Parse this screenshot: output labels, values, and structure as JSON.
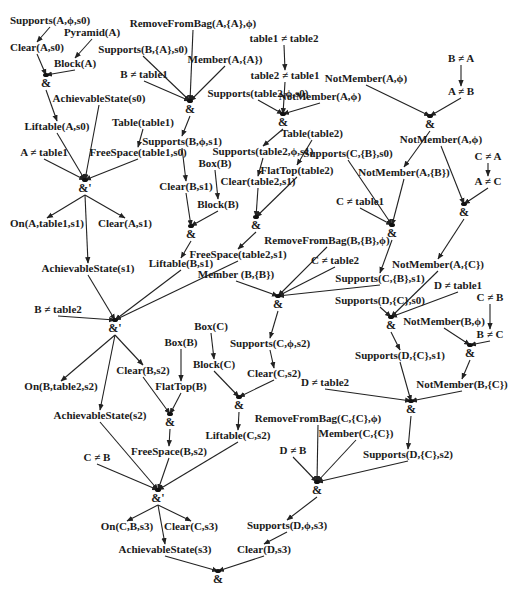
{
  "diagram": {
    "type": "and-or derivation graph",
    "nodes": [
      {
        "id": "n1",
        "label": "Supports(A,ϕ,s0)",
        "x": 50,
        "y": 24
      },
      {
        "id": "n2",
        "label": "Pyramid(A)",
        "x": 92,
        "y": 36
      },
      {
        "id": "n3",
        "label": "Clear(A,s0)",
        "x": 37,
        "y": 51
      },
      {
        "id": "n4",
        "label": "Block(A)",
        "x": 75,
        "y": 67
      },
      {
        "id": "n5",
        "label": "RemoveFromBag(A,{A},ϕ)",
        "x": 193,
        "y": 27
      },
      {
        "id": "n6",
        "label": "Supports(B,{A},s0)",
        "x": 143,
        "y": 53
      },
      {
        "id": "n7",
        "label": "Member(A,{A})",
        "x": 225,
        "y": 63
      },
      {
        "id": "n8",
        "label": "B ≠ table1",
        "x": 144,
        "y": 78
      },
      {
        "id": "n9",
        "label": "AchievableState(s0)",
        "x": 99,
        "y": 102
      },
      {
        "id": "n10",
        "label": "Liftable(A,s0)",
        "x": 57,
        "y": 130
      },
      {
        "id": "n11",
        "label": "Table(table1)",
        "x": 143,
        "y": 126
      },
      {
        "id": "n12",
        "label": "Supports(B,ϕ,s1)",
        "x": 182,
        "y": 145
      },
      {
        "id": "n13",
        "label": "A ≠ table1",
        "x": 44,
        "y": 156
      },
      {
        "id": "n14",
        "label": "FreeSpace(table1,s0)",
        "x": 138,
        "y": 156
      },
      {
        "id": "n15",
        "label": "Box(B)",
        "x": 215,
        "y": 167
      },
      {
        "id": "n16",
        "label": "Clear(B,s1)",
        "x": 186,
        "y": 190
      },
      {
        "id": "n17",
        "label": "Block(B)",
        "x": 218,
        "y": 208
      },
      {
        "id": "n18",
        "label": "On(A,table1,s1)",
        "x": 47,
        "y": 227
      },
      {
        "id": "n19",
        "label": "Clear(A,s1)",
        "x": 125,
        "y": 227
      },
      {
        "id": "n20",
        "label": "Liftable(B,s1)",
        "x": 181,
        "y": 267
      },
      {
        "id": "n21",
        "label": "AchievableState(s1)",
        "x": 88,
        "y": 272
      },
      {
        "id": "n22",
        "label": "table1 ≠ table2",
        "x": 284,
        "y": 42
      },
      {
        "id": "n23",
        "label": "table2 ≠ table1",
        "x": 285,
        "y": 79
      },
      {
        "id": "n24",
        "label": "Supports(table2,ϕ,s0)",
        "x": 258,
        "y": 97
      },
      {
        "id": "n25",
        "label": "NotMember(A,ϕ)",
        "x": 320,
        "y": 100
      },
      {
        "id": "n26",
        "label": "Supports(table2,ϕ,s1)",
        "x": 263,
        "y": 155
      },
      {
        "id": "n27",
        "label": "Table(table2)",
        "x": 312,
        "y": 137
      },
      {
        "id": "n28",
        "label": "Clear(table2,s1)",
        "x": 258,
        "y": 185
      },
      {
        "id": "n29",
        "label": "FlatTop(table2)",
        "x": 297,
        "y": 174
      },
      {
        "id": "n30",
        "label": "Supports(C,{B},s0)",
        "x": 348,
        "y": 157
      },
      {
        "id": "n31",
        "label": "B ≠ A",
        "x": 461,
        "y": 62
      },
      {
        "id": "n32",
        "label": "NotMember(A,ϕ)",
        "x": 366,
        "y": 82
      },
      {
        "id": "n33",
        "label": "A ≠ B",
        "x": 461,
        "y": 95
      },
      {
        "id": "n34",
        "label": "NotMember(A,ϕ)",
        "x": 441,
        "y": 143
      },
      {
        "id": "n35",
        "label": "NotMember(A,{B})",
        "x": 404,
        "y": 176
      },
      {
        "id": "n36",
        "label": "C ≠ A",
        "x": 488,
        "y": 160
      },
      {
        "id": "n37",
        "label": "A ≠ C",
        "x": 488,
        "y": 185
      },
      {
        "id": "n38",
        "label": "C ≠ table1",
        "x": 360,
        "y": 205
      },
      {
        "id": "n39",
        "label": "RemoveFromBag(B,{B},ϕ)",
        "x": 327,
        "y": 244
      },
      {
        "id": "n40",
        "label": "FreeSpace(table2,s1)",
        "x": 238,
        "y": 258
      },
      {
        "id": "n41",
        "label": "C ≠ table2",
        "x": 335,
        "y": 264
      },
      {
        "id": "n42",
        "label": "Member (B,{B})",
        "x": 236,
        "y": 278
      },
      {
        "id": "n43",
        "label": "Supports(C,{B},s1)",
        "x": 380,
        "y": 282
      },
      {
        "id": "n44",
        "label": "NotMember(A,{C})",
        "x": 438,
        "y": 268
      },
      {
        "id": "n45",
        "label": "D ≠ table1",
        "x": 458,
        "y": 289
      },
      {
        "id": "n46",
        "label": "Supports(D,{C},s0)",
        "x": 380,
        "y": 304
      },
      {
        "id": "n47",
        "label": "C ≠ B",
        "x": 490,
        "y": 301
      },
      {
        "id": "n48",
        "label": "NotMember(B,ϕ)",
        "x": 444,
        "y": 325
      },
      {
        "id": "n49",
        "label": "B ≠ C",
        "x": 490,
        "y": 338
      },
      {
        "id": "n50",
        "label": "B ≠ table2",
        "x": 58,
        "y": 313
      },
      {
        "id": "n51",
        "label": "Box(C)",
        "x": 211,
        "y": 330
      },
      {
        "id": "n52",
        "label": "Supports(C,ϕ,s2)",
        "x": 270,
        "y": 347
      },
      {
        "id": "n53",
        "label": "Box(B)",
        "x": 181,
        "y": 346
      },
      {
        "id": "n54",
        "label": "Supports(D,{C},s1)",
        "x": 400,
        "y": 359
      },
      {
        "id": "n55",
        "label": "Block(C)",
        "x": 214,
        "y": 368
      },
      {
        "id": "n56",
        "label": "Clear(B,s2)",
        "x": 143,
        "y": 374
      },
      {
        "id": "n57",
        "label": "Clear(C,s2)",
        "x": 274,
        "y": 377
      },
      {
        "id": "n58",
        "label": "On(B,table2,s2)",
        "x": 61,
        "y": 390
      },
      {
        "id": "n59",
        "label": "FlatTop(B)",
        "x": 181,
        "y": 390
      },
      {
        "id": "n60",
        "label": "D ≠ table2",
        "x": 325,
        "y": 386
      },
      {
        "id": "n61",
        "label": "NotMember(B,{C})",
        "x": 462,
        "y": 388
      },
      {
        "id": "n62",
        "label": "AchievableState(s2)",
        "x": 100,
        "y": 419
      },
      {
        "id": "n63",
        "label": "Liftable(C,s2)",
        "x": 238,
        "y": 439
      },
      {
        "id": "n64",
        "label": "RemoveFromBag(C,{C},ϕ)",
        "x": 318,
        "y": 422
      },
      {
        "id": "n65",
        "label": "Member(C,{C})",
        "x": 356,
        "y": 437
      },
      {
        "id": "n66",
        "label": "FreeSpace(B,s2)",
        "x": 169,
        "y": 455
      },
      {
        "id": "n67",
        "label": "C ≠ B",
        "x": 97,
        "y": 461
      },
      {
        "id": "n68",
        "label": "D ≠ B",
        "x": 293,
        "y": 454
      },
      {
        "id": "n69",
        "label": "Supports(D,{C},s2)",
        "x": 408,
        "y": 458
      },
      {
        "id": "n70",
        "label": "On(C,B,s3)",
        "x": 127,
        "y": 530
      },
      {
        "id": "n71",
        "label": "Clear(C,s3)",
        "x": 191,
        "y": 530
      },
      {
        "id": "n72",
        "label": "AchievableState(s3)",
        "x": 165,
        "y": 553
      },
      {
        "id": "n73",
        "label": "Supports(D,ϕ,s3)",
        "x": 287,
        "y": 529
      },
      {
        "id": "n74",
        "label": "Clear(D,s3)",
        "x": 264,
        "y": 553
      }
    ],
    "and_nodes": [
      {
        "id": "a1",
        "label": "&",
        "x": 46,
        "y": 87
      },
      {
        "id": "a2",
        "label": "&",
        "x": 190,
        "y": 113
      },
      {
        "id": "a3",
        "label": "&'",
        "x": 85,
        "y": 192
      },
      {
        "id": "a4",
        "label": "&",
        "x": 283,
        "y": 126
      },
      {
        "id": "a5",
        "label": "&",
        "x": 430,
        "y": 128
      },
      {
        "id": "a6",
        "label": "&",
        "x": 191,
        "y": 238
      },
      {
        "id": "a7",
        "label": "&",
        "x": 256,
        "y": 229
      },
      {
        "id": "a8",
        "label": "&",
        "x": 392,
        "y": 237
      },
      {
        "id": "a9",
        "label": "&",
        "x": 464,
        "y": 216
      },
      {
        "id": "a10",
        "label": "&",
        "x": 278,
        "y": 308
      },
      {
        "id": "a11",
        "label": "&",
        "x": 391,
        "y": 329
      },
      {
        "id": "a12",
        "label": "&",
        "x": 470,
        "y": 357
      },
      {
        "id": "a13",
        "label": "&'",
        "x": 115,
        "y": 332
      },
      {
        "id": "a14",
        "label": "&",
        "x": 170,
        "y": 426
      },
      {
        "id": "a15",
        "label": "&",
        "x": 239,
        "y": 409
      },
      {
        "id": "a16",
        "label": "&",
        "x": 411,
        "y": 413
      },
      {
        "id": "a17",
        "label": "&'",
        "x": 158,
        "y": 502
      },
      {
        "id": "a18",
        "label": "&",
        "x": 317,
        "y": 494
      },
      {
        "id": "a19",
        "label": "&",
        "x": 218,
        "y": 583
      }
    ],
    "edges": [
      [
        "n1",
        "a_clearA_s0"
      ],
      [
        "n3",
        "a1"
      ],
      [
        "n4",
        "a1"
      ],
      [
        "n2",
        "n4"
      ],
      [
        "n1",
        "n3"
      ],
      [
        "a1",
        "n10"
      ],
      [
        "n5",
        "a2"
      ],
      [
        "n6",
        "a2"
      ],
      [
        "n7",
        "a2"
      ],
      [
        "n8",
        "a2"
      ],
      [
        "a2",
        "n12"
      ],
      [
        "n10",
        "a3"
      ],
      [
        "n9",
        "a3"
      ],
      [
        "n13",
        "a3"
      ],
      [
        "n14",
        "a3"
      ],
      [
        "n11",
        "n14"
      ],
      [
        "a3",
        "n18"
      ],
      [
        "a3",
        "n19"
      ],
      [
        "a3",
        "n21"
      ],
      [
        "n12",
        "n16"
      ],
      [
        "n15",
        "n17"
      ],
      [
        "n16",
        "a6"
      ],
      [
        "n17",
        "a6"
      ],
      [
        "a6",
        "n20"
      ],
      [
        "n22",
        "n23"
      ],
      [
        "n23",
        "a4"
      ],
      [
        "n24",
        "a4"
      ],
      [
        "n25",
        "a4"
      ],
      [
        "a4",
        "n26"
      ],
      [
        "n26",
        "n28"
      ],
      [
        "n27",
        "n29"
      ],
      [
        "n28",
        "a7"
      ],
      [
        "n29",
        "a7"
      ],
      [
        "a7",
        "n40"
      ],
      [
        "n31",
        "n33"
      ],
      [
        "n32",
        "a5"
      ],
      [
        "n33",
        "a5"
      ],
      [
        "a5",
        "n35"
      ],
      [
        "n30",
        "a8"
      ],
      [
        "n35",
        "a8"
      ],
      [
        "n38",
        "a8"
      ],
      [
        "a8",
        "n43"
      ],
      [
        "n36",
        "n37"
      ],
      [
        "n34",
        "a9"
      ],
      [
        "n37",
        "a9"
      ],
      [
        "a9",
        "n44"
      ],
      [
        "n39",
        "a10"
      ],
      [
        "n41",
        "a10"
      ],
      [
        "n42",
        "a10"
      ],
      [
        "n43",
        "a10"
      ],
      [
        "a10",
        "n52"
      ],
      [
        "n44",
        "a11"
      ],
      [
        "n45",
        "a11"
      ],
      [
        "n46",
        "a11"
      ],
      [
        "a11",
        "n54"
      ],
      [
        "n47",
        "n49"
      ],
      [
        "n48",
        "a12"
      ],
      [
        "n49",
        "a12"
      ],
      [
        "a12",
        "n61"
      ],
      [
        "n21",
        "a13"
      ],
      [
        "n20",
        "a13"
      ],
      [
        "n40",
        "a13"
      ],
      [
        "n50",
        "a13"
      ],
      [
        "a13",
        "n58"
      ],
      [
        "a13",
        "n56"
      ],
      [
        "a13",
        "n62"
      ],
      [
        "n53",
        "n59"
      ],
      [
        "n56",
        "a14"
      ],
      [
        "n59",
        "a14"
      ],
      [
        "a14",
        "n66"
      ],
      [
        "n51",
        "n55"
      ],
      [
        "n52",
        "n57"
      ],
      [
        "n55",
        "a15"
      ],
      [
        "n57",
        "a15"
      ],
      [
        "a15",
        "n63"
      ],
      [
        "n54",
        "a16"
      ],
      [
        "n60",
        "a16"
      ],
      [
        "n61",
        "a16"
      ],
      [
        "a16",
        "n69"
      ],
      [
        "n62",
        "a17"
      ],
      [
        "n66",
        "a17"
      ],
      [
        "n63",
        "a17"
      ],
      [
        "n67",
        "a17"
      ],
      [
        "a17",
        "n70"
      ],
      [
        "a17",
        "n71"
      ],
      [
        "a17",
        "n72"
      ],
      [
        "n64",
        "a18"
      ],
      [
        "n65",
        "a18"
      ],
      [
        "n68",
        "a18"
      ],
      [
        "n69",
        "a18"
      ],
      [
        "a18",
        "n73"
      ],
      [
        "n73",
        "n74"
      ],
      [
        "n72",
        "a19"
      ],
      [
        "n74",
        "a19"
      ]
    ]
  }
}
